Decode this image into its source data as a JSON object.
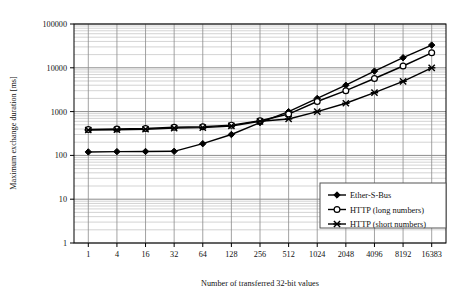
{
  "chart_data": {
    "type": "line",
    "title": "",
    "xlabel": "Number of transferred 32-bit values",
    "ylabel": "Maximum exchange duration [ms]",
    "x_scale": "category",
    "y_scale": "log",
    "ylim": [
      1,
      100000
    ],
    "y_ticks": [
      "1",
      "10",
      "100",
      "1000",
      "10000",
      "100000"
    ],
    "grid": "minor-log-horizontal-and-category-vertical",
    "legend_position": "bottom-right-inside",
    "categories": [
      "1",
      "4",
      "16",
      "32",
      "64",
      "128",
      "256",
      "512",
      "1024",
      "2048",
      "4096",
      "8192",
      "16383"
    ],
    "series": [
      {
        "name": "Ether-S-Bus",
        "marker": "filled-diamond",
        "values": [
          120,
          122,
          123,
          124,
          185,
          300,
          560,
          1000,
          2000,
          4000,
          8400,
          17000,
          33000
        ]
      },
      {
        "name": "HTTP (long numbers)",
        "marker": "open-circle",
        "values": [
          390,
          400,
          410,
          440,
          450,
          490,
          620,
          880,
          1700,
          3000,
          5700,
          11000,
          22000
        ]
      },
      {
        "name": "HTTP (short numbers)",
        "marker": "cross-star",
        "values": [
          380,
          385,
          395,
          420,
          430,
          470,
          600,
          680,
          1000,
          1550,
          2700,
          4900,
          10000
        ]
      }
    ]
  },
  "axes": {
    "y_title": "Maximum exchange duration [ms]",
    "x_title": "Number of transferred 32-bit values"
  },
  "legend": {
    "items": [
      {
        "label": "Ether-S-Bus"
      },
      {
        "label": "HTTP (long numbers)"
      },
      {
        "label": "HTTP (short numbers)"
      }
    ]
  },
  "colors": {
    "line": "#000000",
    "grid_major": "#8c8c8c",
    "grid_minor": "#c8c8c8",
    "axis": "#000000",
    "background": "#ffffff",
    "legend_border": "#555555"
  }
}
